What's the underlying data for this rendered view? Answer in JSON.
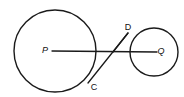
{
  "figure": {
    "width": 184,
    "height": 97,
    "background_color": "#ffffff",
    "stroke_color": "#1a1a1a"
  },
  "circles": [
    {
      "id": "circle-p",
      "center_label": "P",
      "cx": 55,
      "cy": 51,
      "r": 41,
      "role": "large-circle"
    },
    {
      "id": "circle-q",
      "center_label": "Q",
      "cx": 154,
      "cy": 52,
      "r": 24,
      "role": "small-circle"
    }
  ],
  "points": [
    {
      "id": "point-p",
      "label": "P",
      "x": 55,
      "y": 51,
      "label_x": 45,
      "label_y": 51
    },
    {
      "id": "point-q",
      "label": "Q",
      "x": 154,
      "y": 52,
      "label_x": 161,
      "label_y": 52
    },
    {
      "id": "point-c",
      "label": "C",
      "x": 89,
      "y": 82,
      "label_x": 94,
      "label_y": 88
    },
    {
      "id": "point-d",
      "label": "D",
      "x": 126,
      "y": 36,
      "label_x": 128,
      "label_y": 28
    }
  ],
  "segments": [
    {
      "id": "segment-pq",
      "label": "PQ",
      "x1": 52,
      "y1": 51,
      "x2": 157,
      "y2": 52
    },
    {
      "id": "segment-cd",
      "label": "CD",
      "x1": 88,
      "y1": 83,
      "x2": 128,
      "y2": 33
    },
    {
      "id": "segment-d-q-chord",
      "label": "DQ",
      "x1": 128,
      "y1": 33,
      "x2": 113,
      "y2": 52
    }
  ],
  "labels": {
    "p": "P",
    "q": "Q",
    "c": "C",
    "d": "D"
  }
}
